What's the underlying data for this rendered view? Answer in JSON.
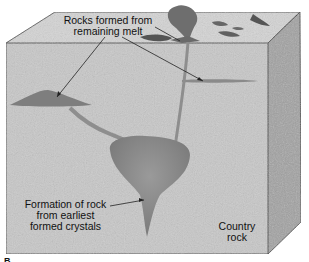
{
  "diagram": {
    "type": "geologic block cross-section",
    "labels": {
      "remaining_melt": [
        "Rocks formed from",
        "remaining melt"
      ],
      "earliest_crystals": [
        "Formation of rock",
        "from earliest",
        "formed crystals"
      ],
      "country_rock": [
        "Country",
        "rock"
      ]
    },
    "panel_letter": "B",
    "colors": {
      "front_face": "#c9c9c9",
      "top_face": "#d6d6d6",
      "side_face": "#9e9e9e",
      "magma": "#8c8c8c",
      "outline": "#333333"
    }
  }
}
